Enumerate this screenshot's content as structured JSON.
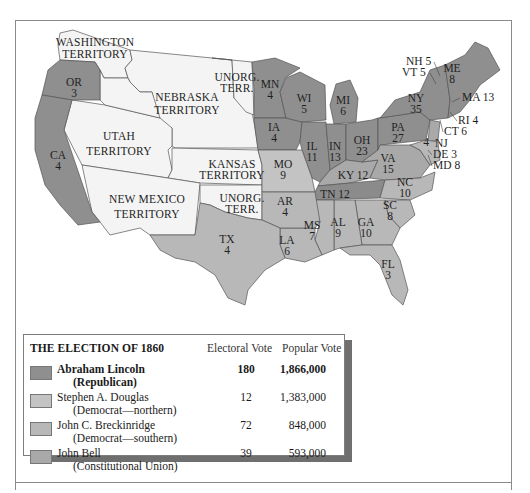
{
  "colors": {
    "republican": "#8f8f8f",
    "democrat_northern": "#c3c3c3",
    "democrat_southern": "#b8b8b8",
    "constitutional_union": "#a9a9a9",
    "territory": "#f4f4f4",
    "water": "#ffffff",
    "border": "#555555"
  },
  "map": {
    "territories": [
      {
        "id": "washington",
        "line1": "WASHINGTON",
        "line2": "TERRITORY"
      },
      {
        "id": "nebraska",
        "line1": "NEBRASKA",
        "line2": "TERRITORY"
      },
      {
        "id": "unorg_north",
        "line1": "UNORG.",
        "line2": "TERR."
      },
      {
        "id": "utah",
        "line1": "UTAH",
        "line2": "TERRITORY"
      },
      {
        "id": "kansas",
        "line1": "KANSAS",
        "line2": "TERRITORY"
      },
      {
        "id": "new_mexico",
        "line1": "NEW MEXICO",
        "line2": "TERRITORY"
      },
      {
        "id": "unorg_south",
        "line1": "UNORG.",
        "line2": "TERR."
      }
    ],
    "states": {
      "OR": {
        "abbr": "OR",
        "ev": "3",
        "winner": "republican"
      },
      "CA": {
        "abbr": "CA",
        "ev": "4",
        "winner": "republican"
      },
      "MN": {
        "abbr": "MN",
        "ev": "4",
        "winner": "republican"
      },
      "IA": {
        "abbr": "IA",
        "ev": "4",
        "winner": "republican"
      },
      "WI": {
        "abbr": "WI",
        "ev": "5",
        "winner": "republican"
      },
      "MI": {
        "abbr": "MI",
        "ev": "6",
        "winner": "republican"
      },
      "IL": {
        "abbr": "IL",
        "ev": "11",
        "winner": "republican"
      },
      "IN": {
        "abbr": "IN",
        "ev": "13",
        "winner": "republican"
      },
      "OH": {
        "abbr": "OH",
        "ev": "23",
        "winner": "republican"
      },
      "PA": {
        "abbr": "PA",
        "ev": "27",
        "winner": "republican"
      },
      "NY": {
        "abbr": "NY",
        "ev": "35",
        "winner": "republican"
      },
      "ME": {
        "abbr": "ME",
        "ev": "8",
        "winner": "republican"
      },
      "NH": {
        "label": "NH 5",
        "winner": "republican"
      },
      "VT": {
        "label": "VT 5",
        "winner": "republican"
      },
      "MA": {
        "label": "MA 13",
        "winner": "republican"
      },
      "RI": {
        "label": "RI 4",
        "winner": "republican"
      },
      "CT": {
        "label": "CT 6",
        "winner": "republican"
      },
      "NJ": {
        "label": "NJ",
        "ev_inset": "4",
        "winner": "split"
      },
      "DE": {
        "label": "DE 3",
        "winner": "democrat_southern"
      },
      "MD": {
        "label": "MD 8",
        "winner": "democrat_southern"
      },
      "MO": {
        "abbr": "MO",
        "ev": "9",
        "winner": "democrat_northern"
      },
      "KY": {
        "label": "KY 12",
        "winner": "constitutional_union"
      },
      "TN": {
        "label": "TN 12",
        "winner": "constitutional_union"
      },
      "VA": {
        "abbr": "VA",
        "ev": "15",
        "winner": "constitutional_union"
      },
      "NC": {
        "abbr": "NC",
        "ev": "10",
        "winner": "democrat_southern"
      },
      "SC": {
        "abbr": "SC",
        "ev": "8",
        "winner": "democrat_southern"
      },
      "GA": {
        "abbr": "GA",
        "ev": "10",
        "winner": "democrat_southern"
      },
      "AL": {
        "abbr": "AL",
        "ev": "9",
        "winner": "democrat_southern"
      },
      "MS": {
        "abbr": "MS",
        "ev": "7",
        "winner": "democrat_southern"
      },
      "LA": {
        "abbr": "LA",
        "ev": "6",
        "winner": "democrat_southern"
      },
      "AR": {
        "abbr": "AR",
        "ev": "4",
        "winner": "democrat_southern"
      },
      "TX": {
        "abbr": "TX",
        "ev": "4",
        "winner": "democrat_southern"
      },
      "FL": {
        "abbr": "FL",
        "ev": "3",
        "winner": "democrat_southern"
      }
    }
  },
  "legend": {
    "title": "THE ELECTION OF 1860",
    "col_electoral": "Electoral Vote",
    "col_popular": "Popular Vote",
    "rows": [
      {
        "name": "Abraham Lincoln",
        "party": "(Republican)",
        "electoral": "180",
        "popular": "1,866,000",
        "color": "#8f8f8f",
        "bold": true
      },
      {
        "name": "Stephen A. Douglas",
        "party": "(Democrat—northern)",
        "electoral": "12",
        "popular": "1,383,000",
        "color": "#c3c3c3",
        "bold": false
      },
      {
        "name": "John C. Breckinridge",
        "party": "(Democrat—southern)",
        "electoral": "72",
        "popular": "848,000",
        "color": "#b8b8b8",
        "bold": false
      },
      {
        "name": "John Bell",
        "party": "(Constitutional Union)",
        "electoral": "39",
        "popular": "593,000",
        "color": "#a9a9a9",
        "bold": false
      }
    ]
  }
}
